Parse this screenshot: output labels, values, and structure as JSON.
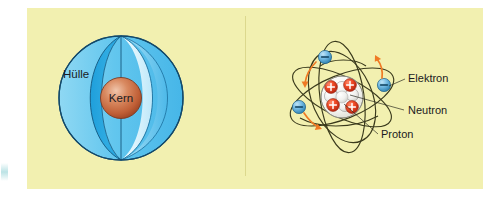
{
  "figure": {
    "background_color": "#f2f0b0",
    "margin_color": "#ffffff",
    "divider_color": "#ddd98f"
  },
  "panels": [
    {
      "id": "shell-model",
      "name": "Schalenmodell / Hülle-Kern-Modell",
      "labels": {
        "shell": "Hülle",
        "nucleus": "Kern"
      },
      "colors": {
        "shell_light": "#bfe6f7",
        "shell_mid": "#7fd0f0",
        "shell_deep": "#29a8e0",
        "shell_outline": "#12496b",
        "nucleus_core": "#c96a45",
        "nucleus_highlight": "#e8b79a",
        "nucleus_outline": "#7a3a22"
      }
    },
    {
      "id": "rutherford-bohr-model",
      "name": "Kern-Hülle-Modell mit Elektronenbahnen",
      "labels": {
        "electron": "Elektron",
        "neutron": "Neutron",
        "proton": "Proton"
      },
      "particles": {
        "electron_charge_sign": "−",
        "proton_charge_sign": "+",
        "electron_count": 4,
        "proton_count": 4,
        "neutron_count": 5
      },
      "colors": {
        "electron_fill": "#6fb9e3",
        "electron_outline": "#1d5f86",
        "proton_fill": "#e23b20",
        "proton_outline": "#8e1d0c",
        "neutron_fill": "#f2f2f2",
        "neutron_outline": "#9a9a9a",
        "orbit_stroke": "#3a3a1c",
        "direction_arrow": "#ef7a24",
        "leader_line": "#2e2e22"
      }
    }
  ]
}
